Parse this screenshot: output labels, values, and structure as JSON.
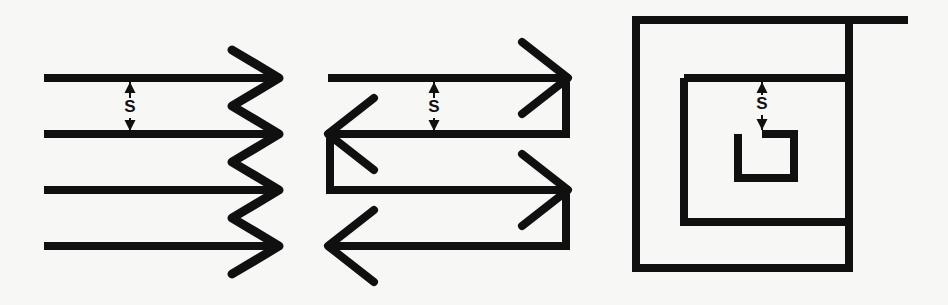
{
  "figure": {
    "background_color": "#f7f7f5",
    "stroke_color": "#101010",
    "canvas": {
      "width": 948,
      "height": 305
    }
  },
  "panels": [
    {
      "id": "panel-zigzag",
      "name": "zigzag-raster-pattern",
      "spacing_label": "S",
      "spacing_label_x": 130,
      "spacing_label_y": 108,
      "dim_arrow_x": 130,
      "dim_arrow_top_y": 82,
      "dim_arrow_bottom_y": 131,
      "line_width": 8,
      "raster_lines": [
        {
          "x1": 44,
          "y1": 78,
          "x2": 278,
          "y2": 78
        },
        {
          "x1": 44,
          "y1": 134,
          "x2": 278,
          "y2": 134
        },
        {
          "x1": 44,
          "y1": 190,
          "x2": 278,
          "y2": 190
        },
        {
          "x1": 44,
          "y1": 246,
          "x2": 278,
          "y2": 246
        }
      ],
      "zigzag_points": "232,50 279,78 232,106 279,134 232,162 279,190 232,218 279,246 232,274",
      "zigzag_width": 9
    },
    {
      "id": "panel-boustrophedon",
      "name": "boustrophedon-arrow-pattern",
      "spacing_label": "S",
      "spacing_label_x": 434,
      "spacing_label_y": 108,
      "dim_arrow_x": 434,
      "dim_arrow_top_y": 82,
      "dim_arrow_bottom_y": 131,
      "line_width": 8,
      "path_points": "328,78 566,78 566,134 330,134 330,190 566,190 566,246 330,246",
      "arrowheads": [
        {
          "name": "arrowhead-right-top",
          "direction": "right",
          "tip_x": 566,
          "tip_y": 78,
          "points": "522,42 568,78 522,114"
        },
        {
          "name": "arrowhead-left-middle",
          "direction": "left",
          "tip_x": 330,
          "tip_y": 134,
          "points": "374,98 328,134 374,170"
        },
        {
          "name": "arrowhead-right-bottom",
          "direction": "right",
          "tip_x": 566,
          "tip_y": 190,
          "points": "522,154 568,190 522,226"
        },
        {
          "name": "arrowhead-left-bottom",
          "direction": "left",
          "tip_x": 330,
          "tip_y": 246,
          "points": "374,210 328,246 374,282"
        }
      ]
    },
    {
      "id": "panel-concentric",
      "name": "concentric-spiral-pattern",
      "spacing_label": "S",
      "spacing_label_x": 762,
      "spacing_label_y": 105,
      "dim_arrow_x": 762,
      "dim_arrow_top_y": 82,
      "dim_arrow_bottom_y": 130,
      "line_width": 8,
      "outer_spiral_points": "908,20 636,20 636,268 849,268 849,20",
      "middle_square_points": "684,78 849,78 849,222 684,222 684,78",
      "inner_c_points": "762,134 794,134 794,178 738,178 738,134",
      "inner_c_width": 8
    }
  ]
}
